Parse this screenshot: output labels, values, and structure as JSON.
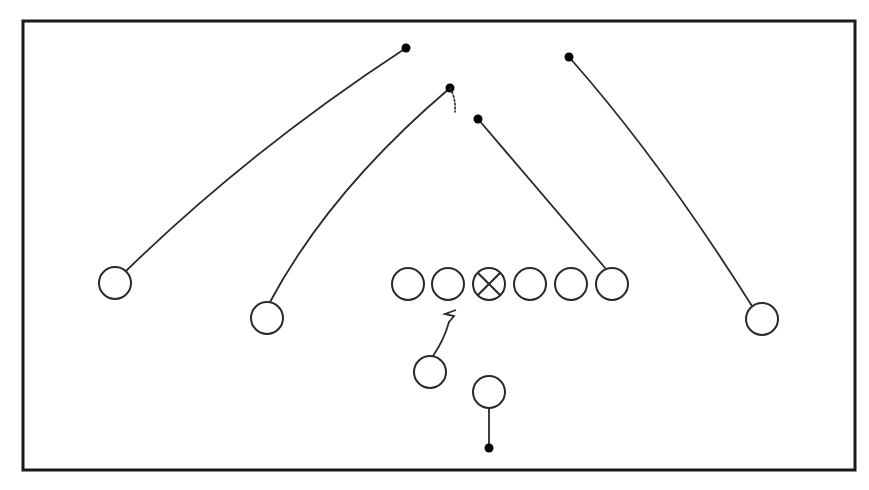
{
  "diagram": {
    "type": "football-play",
    "colors": {
      "stroke": "#2a2a2a",
      "frame": "#1a1a1a",
      "fill": "#ffffff",
      "endpoint": "#000000"
    },
    "frame": {
      "x": 23,
      "y": 21,
      "width": 832,
      "height": 449,
      "stroke_width": 3
    },
    "player_radius": 16,
    "players": [
      {
        "id": "wr-left",
        "role": "wide-receiver",
        "x": 115,
        "y": 283,
        "marker": "circle"
      },
      {
        "id": "slot-left",
        "role": "slot-receiver",
        "x": 267,
        "y": 318,
        "marker": "circle"
      },
      {
        "id": "lt",
        "role": "left-tackle",
        "x": 408,
        "y": 284,
        "marker": "circle"
      },
      {
        "id": "lg",
        "role": "left-guard",
        "x": 448,
        "y": 284,
        "marker": "circle"
      },
      {
        "id": "c",
        "role": "center",
        "x": 489,
        "y": 284,
        "marker": "circle-x"
      },
      {
        "id": "rg",
        "role": "right-guard",
        "x": 530,
        "y": 284,
        "marker": "circle"
      },
      {
        "id": "rt",
        "role": "right-tackle",
        "x": 571,
        "y": 284,
        "marker": "circle"
      },
      {
        "id": "te",
        "role": "tight-end",
        "x": 612,
        "y": 284,
        "marker": "circle"
      },
      {
        "id": "wr-right",
        "role": "wide-receiver",
        "x": 762,
        "y": 319,
        "marker": "circle"
      },
      {
        "id": "rb",
        "role": "running-back",
        "x": 430,
        "y": 372,
        "marker": "circle"
      },
      {
        "id": "qb",
        "role": "quarterback",
        "x": 489,
        "y": 392,
        "marker": "circle"
      }
    ],
    "routes": [
      {
        "player": "wr-left",
        "path": "M126,271 Q250,150 406,48",
        "end": {
          "x": 406,
          "y": 48
        },
        "end_marker": "dot"
      },
      {
        "player": "slot-left",
        "path": "M270,302 Q330,190 450,88",
        "end": {
          "x": 450,
          "y": 88
        },
        "end_marker": "dot"
      },
      {
        "player": "slot-left-option",
        "path": "M450,88 Q456,98 455,112",
        "style": "dashed"
      },
      {
        "player": "te",
        "path": "M606,269 L478,119",
        "end": {
          "x": 478,
          "y": 119
        },
        "end_marker": "dot"
      },
      {
        "player": "wr-right",
        "path": "M752,306 Q660,160 569,57",
        "end": {
          "x": 569,
          "y": 57
        },
        "end_marker": "dot"
      },
      {
        "player": "rb",
        "path": "M433,356 Q444,340 449,322",
        "end_marker": "block-zigzag",
        "block_path": "M449,322 L454,316 L445,314 L456,310"
      },
      {
        "player": "qb",
        "path": "M489,408 L489,448",
        "end": {
          "x": 489,
          "y": 448
        },
        "end_marker": "dot"
      }
    ]
  }
}
